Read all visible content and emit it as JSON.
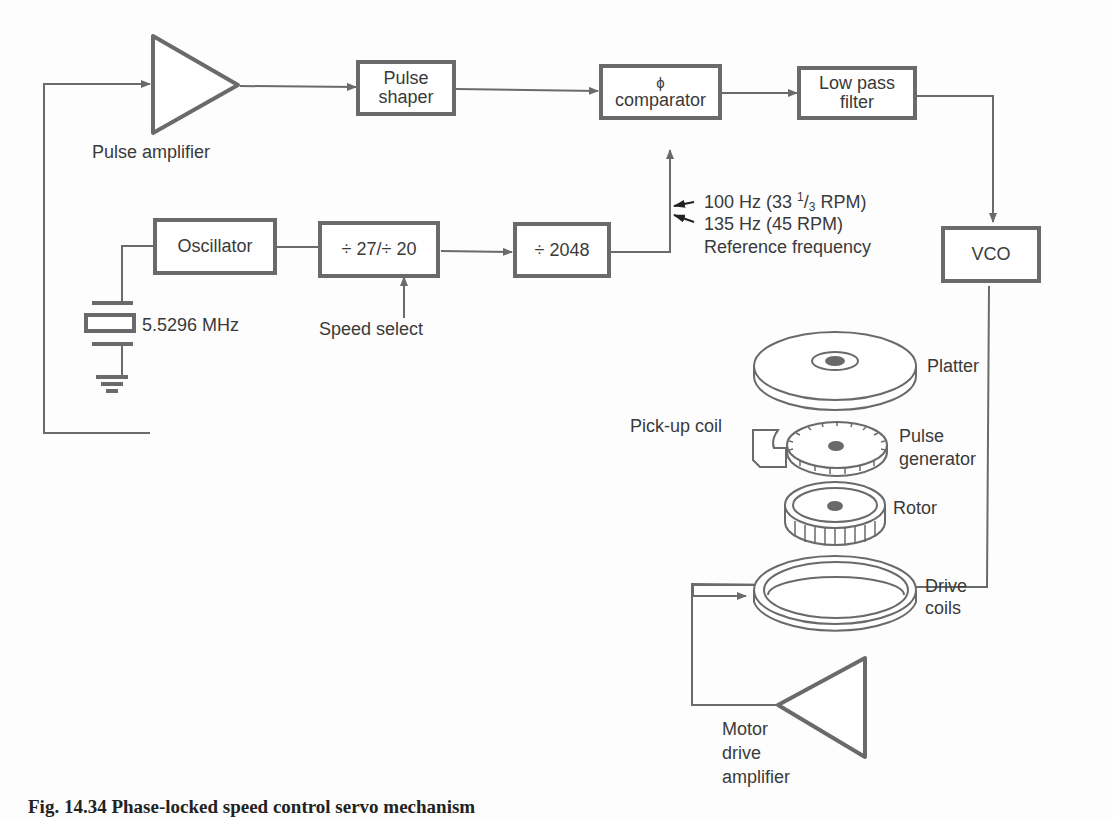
{
  "diagram": {
    "caption": "Fig. 14.34   Phase-locked speed control servo mechanism",
    "blocks": {
      "pulse_amplifier": "Pulse amplifier",
      "pulse_shaper": [
        "Pulse",
        "shaper"
      ],
      "phase_comparator": [
        "ϕ",
        "comparator"
      ],
      "low_pass_filter": [
        "Low pass",
        "filter"
      ],
      "vco": "VCO",
      "oscillator": "Oscillator",
      "divider_speed": "÷ 27/÷ 20",
      "divider_2048": "÷ 2048",
      "motor_drive_amplifier": [
        "Motor",
        "drive",
        "amplifier"
      ]
    },
    "labels": {
      "crystal": "5.5296 MHz",
      "speed_select": "Speed select",
      "ref_100": "100 Hz (33",
      "ref_100_frac_num": "1",
      "ref_100_frac_den": "3",
      "ref_100_tail": " RPM)",
      "ref_135": "135 Hz (45 RPM)",
      "ref_title": "Reference frequency",
      "platter": "Platter",
      "pickup_coil": "Pick-up coil",
      "pulse_generator": [
        "Pulse",
        "generator"
      ],
      "rotor": "Rotor",
      "drive_coils": [
        "Drive",
        "coils"
      ]
    },
    "colors": {
      "line": "#6a6a6a",
      "text": "#3a3a3a",
      "background": "#fdfdfd"
    }
  }
}
